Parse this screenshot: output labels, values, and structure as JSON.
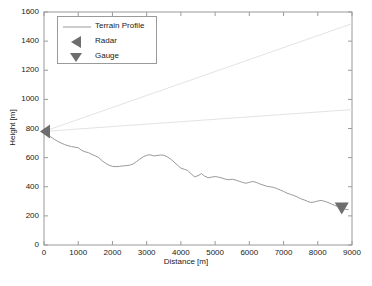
{
  "chart_data": {
    "type": "line",
    "title": "",
    "xlabel": "Distance [m]",
    "ylabel": "Height [m]",
    "xlim": [
      0,
      9000
    ],
    "ylim": [
      0,
      1600
    ],
    "xticks": [
      0,
      1000,
      2000,
      3000,
      4000,
      5000,
      6000,
      7000,
      8000,
      9000
    ],
    "yticks": [
      0,
      200,
      400,
      600,
      800,
      1000,
      1200,
      1400,
      1600
    ],
    "grid": false,
    "legend_position": "upper-left",
    "legend": [
      {
        "label": "Terrain Profile",
        "key": "line",
        "color": "#8c8c8c"
      },
      {
        "label": "Radar",
        "key": "left-triangle",
        "color": "#6e6e6e"
      },
      {
        "label": "Gauge",
        "key": "down-triangle",
        "color": "#6e6e6e"
      }
    ],
    "series": [
      {
        "name": "Terrain Profile",
        "type": "line",
        "color": "#9a9a9a",
        "x": [
          0,
          100,
          200,
          300,
          400,
          500,
          600,
          700,
          800,
          900,
          1000,
          1100,
          1200,
          1300,
          1400,
          1500,
          1600,
          1700,
          1800,
          1900,
          2000,
          2100,
          2200,
          2300,
          2400,
          2500,
          2600,
          2700,
          2800,
          2900,
          3000,
          3100,
          3200,
          3300,
          3400,
          3500,
          3600,
          3700,
          3800,
          3900,
          4000,
          4100,
          4200,
          4300,
          4400,
          4500,
          4600,
          4700,
          4800,
          4900,
          5000,
          5100,
          5200,
          5300,
          5400,
          5500,
          5600,
          5700,
          5800,
          5900,
          6000,
          6100,
          6200,
          6300,
          6400,
          6500,
          6600,
          6700,
          6800,
          6900,
          7000,
          7100,
          7200,
          7300,
          7400,
          7500,
          7600,
          7700,
          7800,
          7900,
          8000,
          8100,
          8200,
          8300,
          8400,
          8500,
          8600,
          8700,
          8800,
          8900
        ],
        "y": [
          780,
          760,
          742,
          726,
          712,
          700,
          690,
          682,
          676,
          672,
          668,
          650,
          640,
          634,
          622,
          612,
          600,
          578,
          562,
          548,
          540,
          538,
          540,
          543,
          545,
          548,
          556,
          572,
          590,
          606,
          616,
          620,
          612,
          614,
          618,
          616,
          606,
          590,
          570,
          548,
          528,
          520,
          512,
          488,
          468,
          476,
          490,
          472,
          462,
          466,
          470,
          466,
          460,
          452,
          448,
          452,
          446,
          438,
          430,
          424,
          430,
          436,
          430,
          420,
          412,
          404,
          400,
          396,
          388,
          378,
          368,
          356,
          348,
          340,
          330,
          318,
          310,
          300,
          292,
          296,
          302,
          306,
          300,
          292,
          282,
          272,
          262,
          252,
          246,
          242
        ]
      },
      {
        "name": "Upper Beam Boundary",
        "type": "line",
        "color": "#e3e3e3",
        "x": [
          0,
          9000
        ],
        "y": [
          780,
          1520
        ]
      },
      {
        "name": "Lower Beam Boundary",
        "type": "line",
        "color": "#e3e3e3",
        "x": [
          0,
          9000
        ],
        "y": [
          780,
          930
        ]
      }
    ],
    "markers": [
      {
        "name": "Radar",
        "x": 0,
        "y": 780,
        "shape": "left-triangle",
        "color": "#6e6e6e"
      },
      {
        "name": "Gauge",
        "x": 8700,
        "y": 250,
        "shape": "down-triangle",
        "color": "#6e6e6e"
      }
    ]
  },
  "caption": ""
}
